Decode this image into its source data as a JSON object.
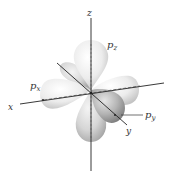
{
  "diagram": {
    "type": "p-orbitals-3d",
    "axes": {
      "x": "x",
      "y": "y",
      "z": "z"
    },
    "orbitals": [
      {
        "name": "p_x",
        "base": "p",
        "sub": "x"
      },
      {
        "name": "p_y",
        "base": "p",
        "sub": "y"
      },
      {
        "name": "p_z",
        "base": "p",
        "sub": "z"
      }
    ],
    "colors": {
      "axis": "#222222",
      "lobe_light": "#f2f2f2",
      "lobe_mid": "#cfcfcf",
      "lobe_dark": "#8f8f8f",
      "label": "#333333"
    }
  }
}
